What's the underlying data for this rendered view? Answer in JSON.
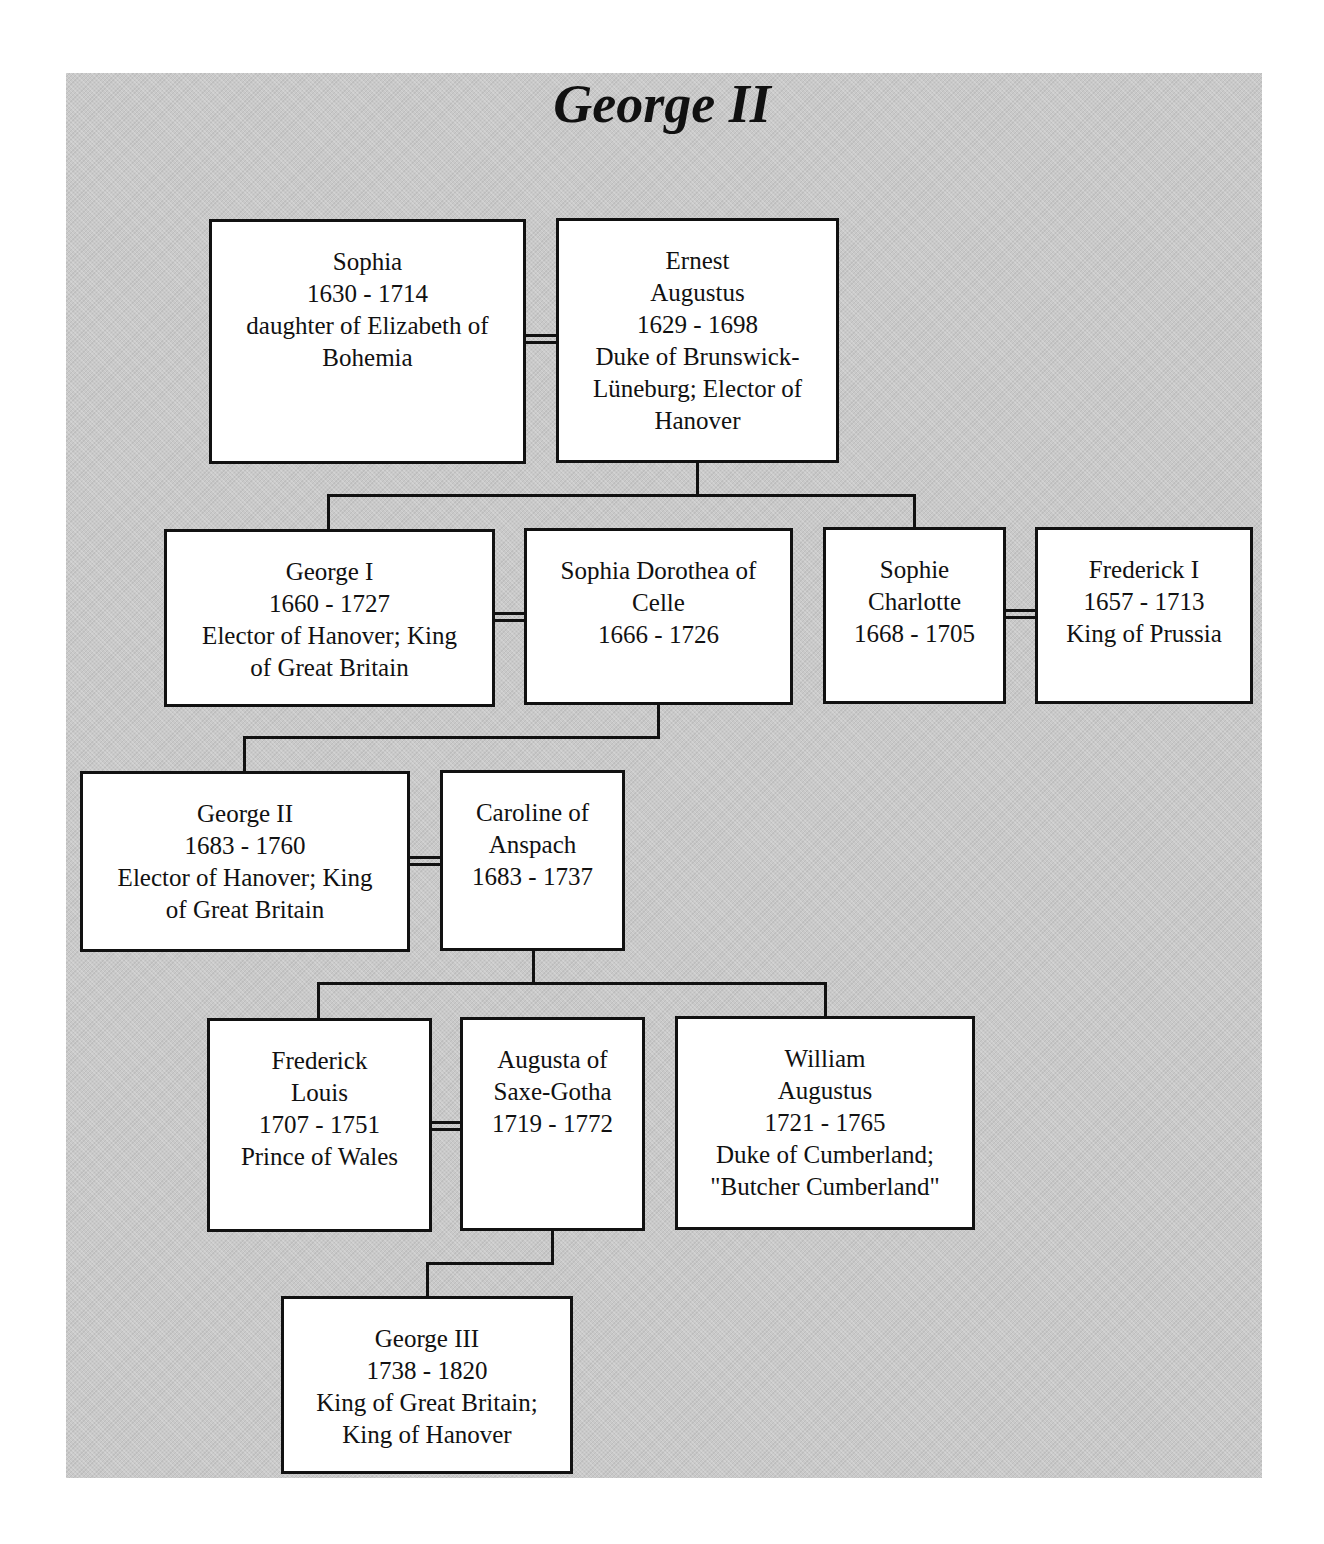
{
  "title": "George II",
  "people": [
    {
      "id": "sophia",
      "name": "Sophia",
      "dates": "1630 - 1714",
      "lines": [
        "daughter of Elizabeth of",
        "Bohemia"
      ]
    },
    {
      "id": "ernest",
      "name": "Ernest",
      "name2": "Augustus",
      "dates": "1629 - 1698",
      "lines": [
        "Duke of Brunswick-",
        "Lüneburg; Elector of",
        "Hanover"
      ]
    },
    {
      "id": "george1",
      "name": "George I",
      "dates": "1660 - 1727",
      "lines": [
        "Elector of Hanover; King",
        "of Great Britain"
      ]
    },
    {
      "id": "sophia-dorothea",
      "name": "Sophia Dorothea of",
      "name2": "Celle",
      "dates": "1666 - 1726",
      "lines": []
    },
    {
      "id": "sophie-charlotte",
      "name": "Sophie",
      "name2": "Charlotte",
      "dates": "1668 - 1705",
      "lines": []
    },
    {
      "id": "frederick1",
      "name": "Frederick I",
      "dates": "1657 - 1713",
      "lines": [
        "King of Prussia"
      ]
    },
    {
      "id": "george2",
      "name": "George II",
      "dates": "1683 - 1760",
      "lines": [
        "Elector of Hanover; King",
        "of Great Britain"
      ]
    },
    {
      "id": "caroline",
      "name": "Caroline of",
      "name2": "Anspach",
      "dates": "1683 - 1737",
      "lines": []
    },
    {
      "id": "frederick-louis",
      "name": "Frederick",
      "name2": "Louis",
      "dates": "1707 - 1751",
      "lines": [
        "Prince of Wales"
      ]
    },
    {
      "id": "augusta",
      "name": "Augusta of",
      "name2": "Saxe-Gotha",
      "dates": "1719 - 1772",
      "lines": []
    },
    {
      "id": "william",
      "name": "William",
      "name2": "Augustus",
      "dates": "1721 - 1765",
      "lines": [
        "Duke of Cumberland;",
        "\"Butcher Cumberland\""
      ]
    },
    {
      "id": "george3",
      "name": "George III",
      "dates": "1738 - 1820",
      "lines": [
        "King of Great Britain;",
        "King of Hanover"
      ]
    }
  ],
  "marriages": [
    [
      "sophia",
      "ernest"
    ],
    [
      "george1",
      "sophia-dorothea"
    ],
    [
      "sophie-charlotte",
      "frederick1"
    ],
    [
      "george2",
      "caroline"
    ],
    [
      "frederick-louis",
      "augusta"
    ]
  ],
  "descents": [
    {
      "parents": [
        "sophia",
        "ernest"
      ],
      "children": [
        "george1",
        "sophie-charlotte"
      ]
    },
    {
      "parents": [
        "george1",
        "sophia-dorothea"
      ],
      "children": [
        "george2"
      ]
    },
    {
      "parents": [
        "george2",
        "caroline"
      ],
      "children": [
        "frederick-louis",
        "william"
      ]
    },
    {
      "parents": [
        "frederick-louis",
        "augusta"
      ],
      "children": [
        "george3"
      ]
    }
  ]
}
